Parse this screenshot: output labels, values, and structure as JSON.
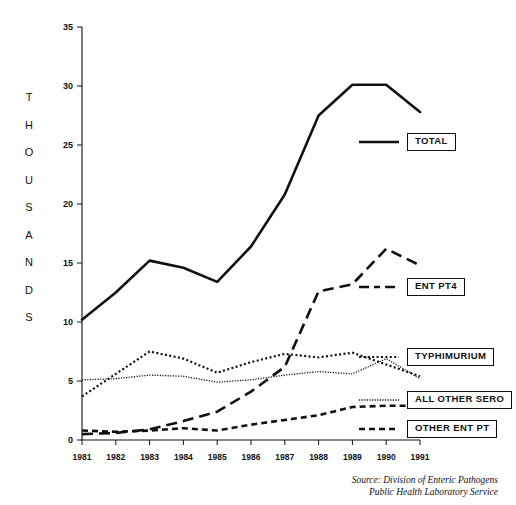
{
  "axis": {
    "y_label_letters": [
      "T",
      "H",
      "O",
      "U",
      "S",
      "A",
      "N",
      "D",
      "S"
    ],
    "y_ticks": [
      "0",
      "5",
      "10",
      "15",
      "20",
      "25",
      "30",
      "35"
    ],
    "x_ticks": [
      "1981",
      "1982",
      "1983",
      "1984",
      "1985",
      "1986",
      "1987",
      "1988",
      "1989",
      "1990",
      "1991"
    ]
  },
  "legend": {
    "items": [
      {
        "label": "TOTAL",
        "style": "solid"
      },
      {
        "label": "ENT PT4",
        "style": "long-dash"
      },
      {
        "label": "TYPHIMURIUM",
        "style": "dotted"
      },
      {
        "label": "ALL OTHER SERO",
        "style": "fine-dotted"
      },
      {
        "label": "OTHER ENT PT",
        "style": "dash"
      }
    ]
  },
  "source": {
    "line1": "Source: Division of Enteric Pathogens",
    "line2": "Public Health Laboratory Service"
  },
  "colors": {
    "line": "#111111",
    "background": "#ffffff"
  },
  "chart_data": {
    "type": "line",
    "title": "",
    "xlabel": "",
    "ylabel": "THOUSANDS",
    "xlim": [
      1981,
      1991
    ],
    "ylim": [
      0,
      35
    ],
    "y_tick_step": 5,
    "grid": false,
    "legend_position": "right",
    "x": [
      1981,
      1982,
      1983,
      1984,
      1985,
      1986,
      1987,
      1988,
      1989,
      1990,
      1991
    ],
    "series": [
      {
        "name": "TOTAL",
        "style": "solid",
        "values": [
          10.2,
          12.5,
          15.2,
          14.6,
          13.4,
          16.4,
          20.8,
          27.5,
          30.1,
          30.1,
          27.8
        ]
      },
      {
        "name": "ENT PT4",
        "style": "long-dash",
        "values": [
          0.5,
          0.6,
          0.9,
          1.6,
          2.4,
          4.1,
          6.2,
          12.6,
          13.2,
          16.2,
          14.8
        ]
      },
      {
        "name": "TYPHIMURIUM",
        "style": "dotted",
        "values": [
          3.7,
          5.6,
          7.5,
          6.9,
          5.7,
          6.6,
          7.3,
          7.0,
          7.4,
          6.4,
          5.4
        ]
      },
      {
        "name": "ALL OTHER SERO",
        "style": "fine-dotted",
        "values": [
          5.1,
          5.2,
          5.5,
          5.4,
          4.9,
          5.1,
          5.5,
          5.8,
          5.6,
          6.9,
          5.2
        ]
      },
      {
        "name": "OTHER ENT PT",
        "style": "dash",
        "values": [
          0.8,
          0.7,
          0.8,
          1.0,
          0.8,
          1.3,
          1.7,
          2.1,
          2.8,
          2.9,
          2.9
        ]
      }
    ]
  }
}
